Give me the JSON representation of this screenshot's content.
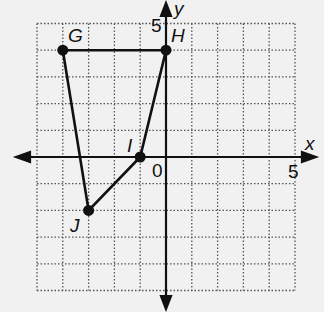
{
  "figure": {
    "type": "coordinate-plane",
    "x_axis_label": "x",
    "y_axis_label": "y",
    "origin_label": "0",
    "x_tick_label": "5",
    "y_tick_label": "5",
    "x_range": [
      -5,
      5
    ],
    "y_range": [
      -5,
      5
    ],
    "grid": "dotted",
    "colors": {
      "line": "#111111",
      "grid": "#555555",
      "background": "#f1f1f1"
    }
  },
  "polygon": {
    "name": "GHIJ",
    "vertices": [
      {
        "label": "G",
        "x": -4,
        "y": 4
      },
      {
        "label": "H",
        "x": 0,
        "y": 4
      },
      {
        "label": "I",
        "x": -1,
        "y": 0
      },
      {
        "label": "J",
        "x": -3,
        "y": -2
      }
    ]
  }
}
